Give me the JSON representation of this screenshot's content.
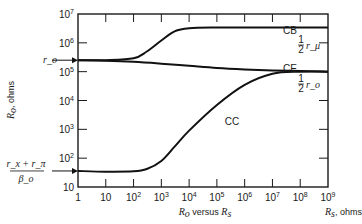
{
  "chart_data": {
    "type": "line",
    "title": "",
    "xlabel": "R_o versus R_s",
    "xlabel_parts": {
      "var": "R",
      "sub": "o",
      "text": " versus ",
      "var2": "R",
      "sub2": "s"
    },
    "x_axis_unit_label": {
      "var": "R",
      "sub": "s",
      "text": ", ohms"
    },
    "ylabel": "R_o, ohms",
    "ylabel_parts": {
      "var": "R",
      "sub": "o",
      "text": ", ohms"
    },
    "x_scale": "log",
    "y_scale": "log",
    "xlim": [
      1,
      1000000000
    ],
    "ylim": [
      10,
      10000000
    ],
    "x_ticks": [
      {
        "value": 1,
        "base": "1",
        "exp": ""
      },
      {
        "value": 10,
        "base": "10",
        "exp": ""
      },
      {
        "value": 100,
        "base": "10",
        "exp": "2"
      },
      {
        "value": 1000,
        "base": "10",
        "exp": "3"
      },
      {
        "value": 10000,
        "base": "10",
        "exp": "4"
      },
      {
        "value": 100000,
        "base": "10",
        "exp": "5"
      },
      {
        "value": 1000000,
        "base": "10",
        "exp": "6"
      },
      {
        "value": 10000000,
        "base": "10",
        "exp": "7"
      },
      {
        "value": 100000000,
        "base": "10",
        "exp": "8"
      },
      {
        "value": 1000000000,
        "base": "10",
        "exp": "9"
      }
    ],
    "y_ticks": [
      {
        "value": 10,
        "base": "10",
        "exp": ""
      },
      {
        "value": 100,
        "base": "10",
        "exp": "2"
      },
      {
        "value": 1000,
        "base": "10",
        "exp": "3"
      },
      {
        "value": 10000,
        "base": "10",
        "exp": "4"
      },
      {
        "value": 100000,
        "base": "10",
        "exp": "5"
      },
      {
        "value": 1000000,
        "base": "10",
        "exp": "6"
      },
      {
        "value": 10000000,
        "base": "10",
        "exp": "7"
      }
    ],
    "grid": false,
    "series": [
      {
        "name": "CB",
        "x": [
          1,
          10,
          100,
          300,
          1000,
          3000,
          10000,
          100000,
          1000000,
          10000000,
          100000000,
          1000000000
        ],
        "y": [
          250000,
          250000,
          290000,
          500000,
          1200000,
          2500000,
          3200000,
          3400000,
          3400000,
          3400000,
          3400000,
          3400000
        ]
      },
      {
        "name": "CE",
        "x": [
          1,
          10,
          100,
          1000,
          10000,
          100000,
          1000000,
          10000000,
          100000000,
          1000000000
        ],
        "y": [
          250000,
          240000,
          220000,
          190000,
          160000,
          135000,
          120000,
          110000,
          105000,
          100000
        ]
      },
      {
        "name": "CC",
        "x": [
          1,
          10,
          100,
          300,
          1000,
          3000,
          10000,
          100000,
          1000000,
          10000000,
          100000000,
          1000000000
        ],
        "y": [
          36,
          34,
          35,
          42,
          80,
          250,
          900,
          7000,
          35000,
          85000,
          100000,
          100000
        ]
      }
    ],
    "annotations": [
      {
        "id": "r-o",
        "text": "r_o",
        "at_y": 250000,
        "side": "left",
        "arrow": true
      },
      {
        "id": "rx-rpi-over-beta",
        "numerator": "r_x + r_π",
        "denominator": "β_o",
        "at_y": 36,
        "side": "left",
        "arrow": true
      },
      {
        "id": "half-r-mu",
        "fraction": "1/2",
        "text": "r_μ",
        "near": "CB",
        "side": "right"
      },
      {
        "id": "half-r-o",
        "fraction": "1/2",
        "text": "r_o",
        "near": "CE/CC",
        "side": "right"
      }
    ]
  }
}
